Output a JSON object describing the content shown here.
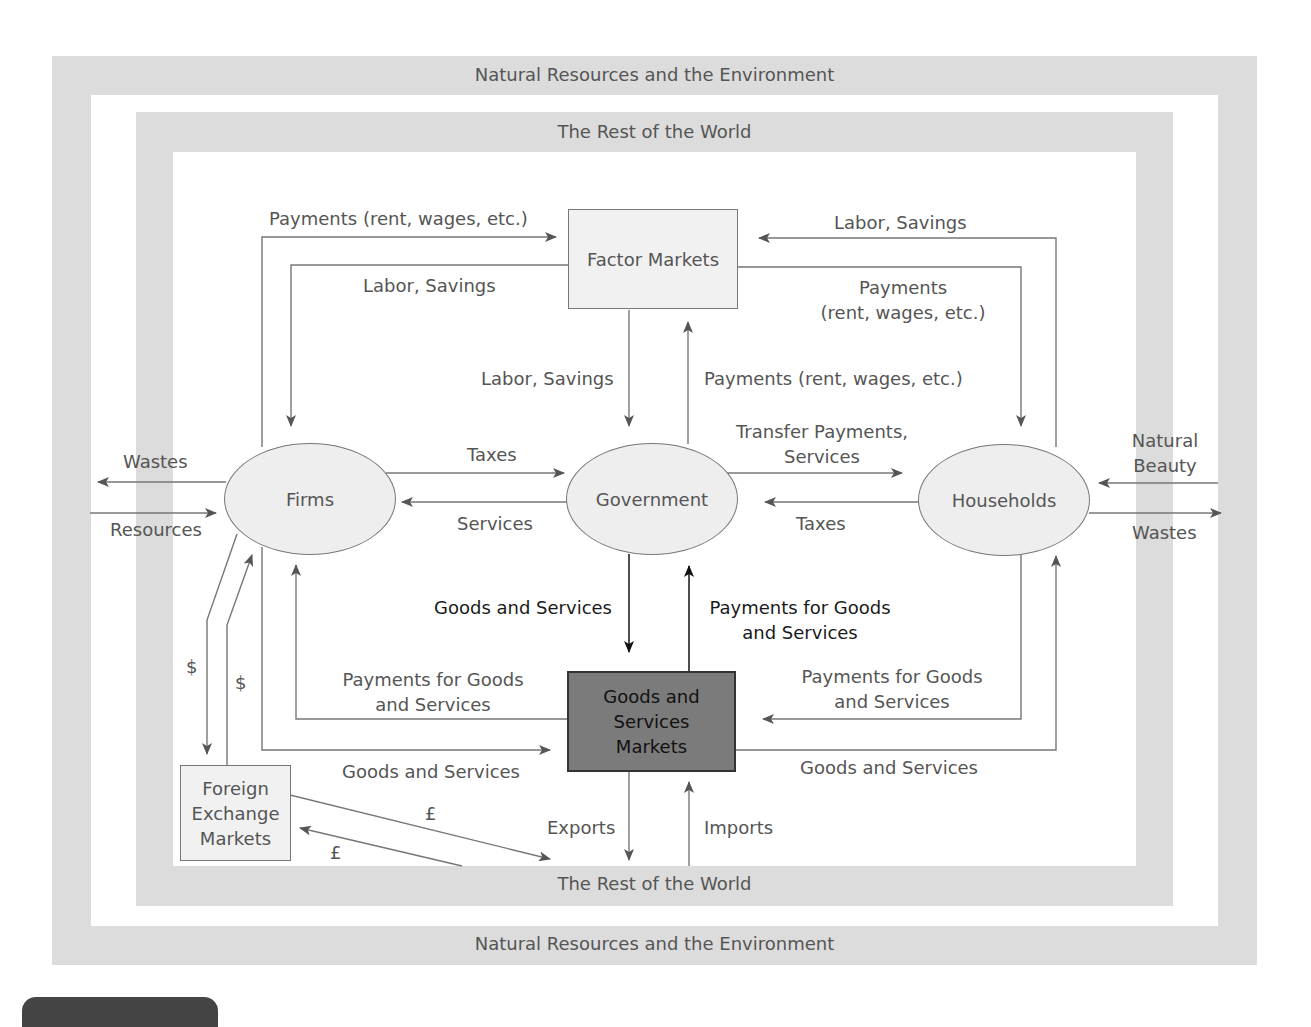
{
  "frames": {
    "outer_top": "Natural Resources and the Environment",
    "outer_bottom": "Natural Resources and the Environment",
    "inner_top": "The Rest of the World",
    "inner_bottom": "The Rest of the World"
  },
  "nodes": {
    "factor_markets": "Factor Markets",
    "firms": "Firms",
    "government": "Government",
    "households": "Households",
    "goods_markets": "Goods and Services Markets",
    "forex": "Foreign Exchange Markets"
  },
  "flows": {
    "firms_to_factor": "Payments (rent, wages, etc.)",
    "factor_to_firms": "Labor, Savings",
    "households_to_factor": "Labor, Savings",
    "factor_to_households_1": "Payments",
    "factor_to_households_2": "(rent, wages, etc.)",
    "factor_to_gov": "Labor, Savings",
    "gov_to_factor": "Payments (rent, wages, etc.)",
    "firms_to_gov": "Taxes",
    "gov_to_firms": "Services",
    "gov_to_households_1": "Transfer Payments,",
    "gov_to_households_2": "Services",
    "households_to_gov": "Taxes",
    "firms_wastes": "Wastes",
    "firms_resources": "Resources",
    "households_beauty_1": "Natural",
    "households_beauty_2": "Beauty",
    "households_wastes": "Wastes",
    "gov_to_goods": "Goods and Services",
    "goods_to_gov_1": "Payments for Goods",
    "goods_to_gov_2": "and Services",
    "goods_to_firms_1": "Payments for Goods",
    "goods_to_firms_2": "and Services",
    "firms_to_goods": "Goods and Services",
    "households_to_goods_1": "Payments for Goods",
    "households_to_goods_2": "and Services",
    "goods_to_households": "Goods and Services",
    "dollar_1": "$",
    "dollar_2": "$",
    "pound_1": "£",
    "pound_2": "£",
    "exports": "Exports",
    "imports": "Imports"
  },
  "colors": {
    "band": "#dcdcdc",
    "node_fill": "#eeeeee",
    "goods_markets_fill": "#7b7b7b",
    "line": "#777777",
    "text": "#555555"
  }
}
